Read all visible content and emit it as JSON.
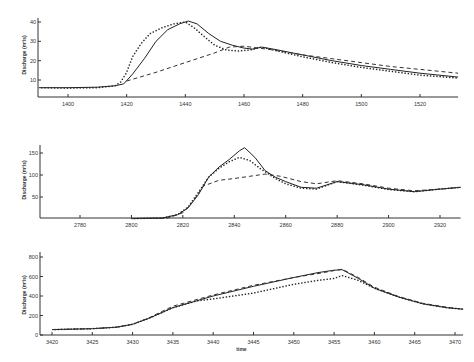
{
  "chart_data": [
    {
      "type": "line",
      "title": "",
      "xlabel": "",
      "ylabel": "Discharge (m³/s)",
      "xlim": [
        1390,
        1533
      ],
      "ylim": [
        0,
        42
      ],
      "xticks": [
        1400,
        1420,
        1440,
        1460,
        1480,
        1500,
        1520
      ],
      "yticks": [
        10,
        20,
        30,
        40
      ],
      "grid": false,
      "legend": null,
      "series": [
        {
          "name": "solid",
          "style": "solid",
          "x": [
            1390,
            1400,
            1410,
            1416,
            1419,
            1422,
            1426,
            1430,
            1434,
            1438,
            1441,
            1444,
            1448,
            1452,
            1456,
            1460,
            1463,
            1466,
            1470,
            1480,
            1490,
            1500,
            1510,
            1520,
            1533
          ],
          "y": [
            6,
            6,
            6.3,
            7,
            8,
            13,
            21,
            30,
            36,
            39,
            40.5,
            39,
            34,
            30,
            28,
            26.5,
            26,
            27,
            26,
            23,
            20,
            17.5,
            15.5,
            13.5,
            11.5
          ]
        },
        {
          "name": "dotted",
          "style": "dotted",
          "x": [
            1390,
            1400,
            1410,
            1416,
            1418,
            1420,
            1422,
            1425,
            1428,
            1432,
            1436,
            1440,
            1443,
            1446,
            1450,
            1454,
            1458,
            1462,
            1466,
            1470,
            1480,
            1490,
            1500,
            1510,
            1520,
            1533
          ],
          "y": [
            6,
            5.8,
            6,
            7,
            9,
            14,
            22,
            29,
            34,
            37,
            39,
            40,
            37,
            33,
            28,
            25.5,
            25,
            25.5,
            27,
            25.5,
            22,
            19,
            16.5,
            14.5,
            12.5,
            11
          ]
        },
        {
          "name": "dashed",
          "style": "dashed",
          "x": [
            1420,
            1430,
            1440,
            1450,
            1455,
            1460,
            1470,
            1480,
            1490,
            1500,
            1510,
            1520,
            1533
          ],
          "y": [
            9.5,
            14,
            19,
            24,
            27,
            27.5,
            25.5,
            23,
            21,
            19,
            17,
            15.5,
            13.5
          ]
        }
      ]
    },
    {
      "type": "line",
      "title": "",
      "xlabel": "",
      "ylabel": "Discharge (m³/s)",
      "xlim": [
        2764,
        2928
      ],
      "ylim": [
        0,
        170
      ],
      "xticks": [
        2780,
        2800,
        2820,
        2840,
        2860,
        2880,
        2900,
        2920
      ],
      "yticks": [
        50,
        100,
        150
      ],
      "grid": false,
      "legend": null,
      "series": [
        {
          "name": "solid",
          "style": "solid",
          "x": [
            2764,
            2800,
            2812,
            2818,
            2822,
            2826,
            2830,
            2834,
            2838,
            2842,
            2844,
            2848,
            2852,
            2856,
            2860,
            2866,
            2872,
            2880,
            2890,
            2900,
            2910,
            2920,
            2928
          ],
          "y": [
            1,
            1,
            2,
            10,
            25,
            55,
            95,
            118,
            135,
            155,
            162,
            140,
            110,
            95,
            85,
            72,
            70,
            85,
            78,
            68,
            62,
            68,
            72
          ]
        },
        {
          "name": "dotted",
          "style": "dotted",
          "x": [
            2764,
            2800,
            2812,
            2818,
            2822,
            2826,
            2830,
            2834,
            2838,
            2842,
            2846,
            2850,
            2856,
            2860,
            2866,
            2872,
            2880,
            2890,
            2900,
            2910,
            2920,
            2928
          ],
          "y": [
            1,
            1,
            2,
            10,
            27,
            60,
            95,
            115,
            130,
            140,
            133,
            115,
            92,
            80,
            70,
            68,
            85,
            77,
            67,
            62,
            68,
            72
          ]
        },
        {
          "name": "dashed",
          "style": "dashed",
          "x": [
            2764,
            2800,
            2814,
            2820,
            2824,
            2828,
            2834,
            2840,
            2846,
            2852,
            2858,
            2866,
            2872,
            2880,
            2890,
            2900,
            2910,
            2920,
            2928
          ],
          "y": [
            1,
            1,
            2,
            14,
            40,
            75,
            88,
            92,
            97,
            102,
            97,
            85,
            80,
            87,
            80,
            70,
            64,
            68,
            72
          ]
        }
      ]
    },
    {
      "type": "line",
      "title": "",
      "xlabel": "time",
      "ylabel": "Discharge (m³/s)",
      "xlim": [
        3418,
        3471
      ],
      "ylim": [
        0,
        820
      ],
      "xticks": [
        3420,
        3425,
        3430,
        3435,
        3440,
        3445,
        3450,
        3455,
        3460,
        3465,
        3470
      ],
      "yticks": [
        0,
        200,
        400,
        600,
        800
      ],
      "grid": false,
      "legend": null,
      "series": [
        {
          "name": "solid",
          "style": "solid",
          "x": [
            3418,
            3420,
            3425,
            3428,
            3430,
            3432,
            3435,
            3440,
            3445,
            3450,
            3453,
            3455,
            3456,
            3458,
            3460,
            3463,
            3466,
            3469,
            3471
          ],
          "y": [
            50,
            55,
            65,
            80,
            110,
            170,
            280,
            400,
            500,
            590,
            640,
            665,
            670,
            580,
            480,
            390,
            320,
            280,
            265
          ]
        },
        {
          "name": "dotted",
          "style": "dotted",
          "x": [
            3418,
            3420,
            3425,
            3428,
            3430,
            3432,
            3435,
            3438,
            3440,
            3445,
            3450,
            3453,
            3455,
            3456,
            3458,
            3460,
            3463,
            3466,
            3469,
            3471
          ],
          "y": [
            50,
            55,
            65,
            80,
            110,
            170,
            280,
            350,
            370,
            430,
            520,
            560,
            580,
            610,
            560,
            480,
            390,
            320,
            280,
            265
          ]
        },
        {
          "name": "dashed",
          "style": "dashed",
          "x": [
            3418,
            3420,
            3425,
            3428,
            3430,
            3432,
            3435,
            3440,
            3445,
            3450,
            3453,
            3455,
            3456,
            3458,
            3460,
            3463,
            3466,
            3469,
            3471
          ],
          "y": [
            50,
            55,
            65,
            80,
            110,
            175,
            295,
            410,
            510,
            590,
            630,
            660,
            675,
            590,
            490,
            395,
            325,
            285,
            265
          ]
        }
      ]
    }
  ],
  "panels": [
    {
      "ylabel": "Discharge (m³/s)",
      "xlabel": ""
    },
    {
      "ylabel": "Discharge (m³/s)",
      "xlabel": ""
    },
    {
      "ylabel": "Discharge (m³/s)",
      "xlabel": "time"
    }
  ]
}
